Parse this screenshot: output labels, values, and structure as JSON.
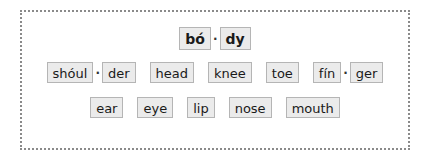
{
  "title_word": {
    "syllables": [
      "bó",
      "dy"
    ]
  },
  "row2": [
    {
      "syllables": [
        "shóul",
        "der"
      ]
    },
    {
      "syllables": [
        "head"
      ]
    },
    {
      "syllables": [
        "knee"
      ]
    },
    {
      "syllables": [
        "toe"
      ]
    },
    {
      "syllables": [
        "fín",
        "ger"
      ]
    }
  ],
  "row3": [
    {
      "syllables": [
        "ear"
      ]
    },
    {
      "syllables": [
        "eye"
      ]
    },
    {
      "syllables": [
        "lip"
      ]
    },
    {
      "syllables": [
        "nose"
      ]
    },
    {
      "syllables": [
        "mouth"
      ]
    }
  ],
  "separator": "·"
}
